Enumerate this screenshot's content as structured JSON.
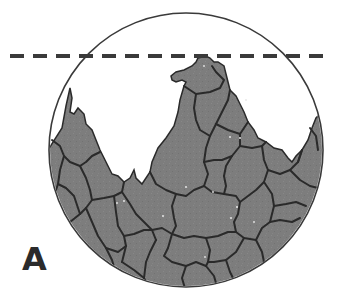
{
  "figure": {
    "panel_label": "A",
    "colors": {
      "background": "#ffffff",
      "cell_fill": "#7d7d7d",
      "cell_boundary": "#2a2a2a",
      "circle_outline": "#3a3a3a",
      "dashed_line": "#3a3a3a"
    },
    "circle": {
      "cx": 186,
      "cy": 150,
      "r": 137
    },
    "dashed_line": {
      "x1": 10,
      "x2": 332,
      "y": 56
    }
  }
}
